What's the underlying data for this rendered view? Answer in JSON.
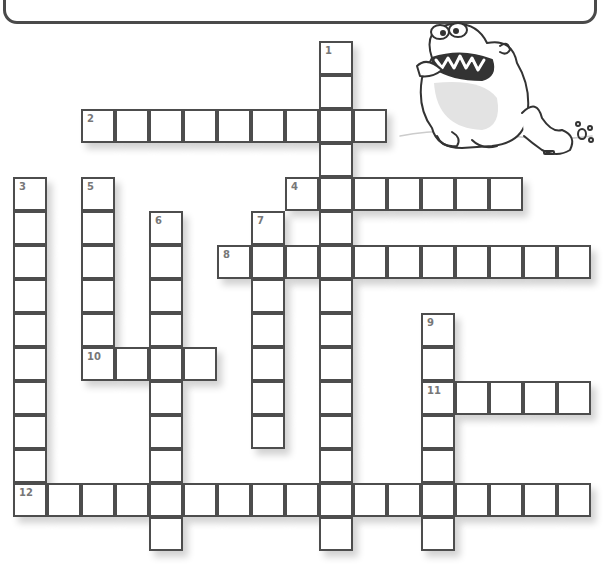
{
  "header": {
    "clue_box_visible": true,
    "clue_lines_cropped": [
      "(cropped clue text, left column)",
      "(cropped clue text, right column)"
    ]
  },
  "puzzle": {
    "cell_size": 34,
    "origin_x": 13,
    "origin_y": 41,
    "border_color": "#4d4d4d",
    "number_color": "#777777",
    "words": [
      {
        "number": "1",
        "direction": "down",
        "col": 9,
        "row": 0,
        "length": 15
      },
      {
        "number": "2",
        "direction": "across",
        "col": 2,
        "row": 2,
        "length": 9
      },
      {
        "number": "3",
        "direction": "down",
        "col": 0,
        "row": 4,
        "length": 10
      },
      {
        "number": "4",
        "direction": "across",
        "col": 8,
        "row": 4,
        "length": 7
      },
      {
        "number": "5",
        "direction": "down",
        "col": 2,
        "row": 4,
        "length": 6
      },
      {
        "number": "6",
        "direction": "down",
        "col": 4,
        "row": 5,
        "length": 10
      },
      {
        "number": "7",
        "direction": "down",
        "col": 7,
        "row": 5,
        "length": 7
      },
      {
        "number": "8",
        "direction": "across",
        "col": 6,
        "row": 6,
        "length": 11
      },
      {
        "number": "9",
        "direction": "down",
        "col": 12,
        "row": 8,
        "length": 7
      },
      {
        "number": "10",
        "direction": "across",
        "col": 2,
        "row": 9,
        "length": 4
      },
      {
        "number": "11",
        "direction": "across",
        "col": 12,
        "row": 10,
        "length": 5
      },
      {
        "number": "12",
        "direction": "across",
        "col": 0,
        "row": 13,
        "length": 17
      }
    ]
  },
  "illustration": {
    "subject": "angry-monster-illustration"
  }
}
